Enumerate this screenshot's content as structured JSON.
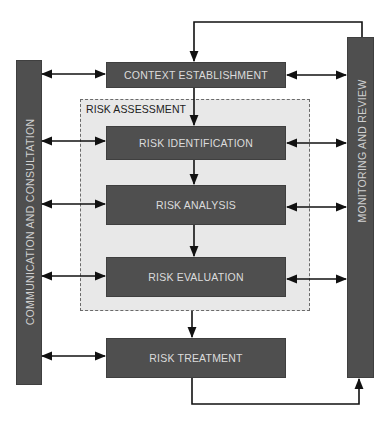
{
  "diagram": {
    "left_bar": {
      "label": "COMMUNICATION AND CONSULTATION"
    },
    "right_bar": {
      "label": "MONITORING AND REVIEW"
    },
    "region": {
      "label": "RISK ASSESSMENT"
    },
    "steps": [
      {
        "id": "context",
        "label": "CONTEXT ESTABLISHMENT"
      },
      {
        "id": "identification",
        "label": "RISK IDENTIFICATION"
      },
      {
        "id": "analysis",
        "label": "RISK ANALYSIS"
      },
      {
        "id": "evaluation",
        "label": "RISK EVALUATION"
      },
      {
        "id": "treatment",
        "label": "RISK TREATMENT"
      }
    ],
    "colors": {
      "box_fill": "#4f4f4f",
      "box_text": "#dcdcdc",
      "region_fill": "#e8e8e8",
      "arrow": "#111111"
    }
  }
}
